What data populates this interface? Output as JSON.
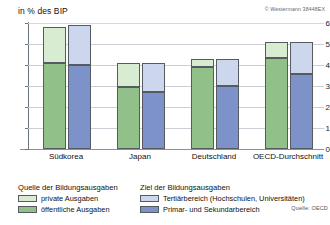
{
  "header": {
    "axis_title": "in % des BIP",
    "copyright": "© Westermann 38448EX"
  },
  "legend": {
    "source_heading": "Quelle der Bildungsausgaben",
    "target_heading": "Ziel der Bildungsausgaben",
    "items": [
      {
        "label": "private Ausgaben",
        "color": "#d8ecd2"
      },
      {
        "label": "öffentliche Ausgaben",
        "color": "#92c089"
      },
      {
        "label": "Tertiärbereich (Hochschulen, Universitäten)",
        "color": "#ccd7ee"
      },
      {
        "label": "Primar- und Sekundarbereich",
        "color": "#7d92c9"
      }
    ],
    "source_note": "Quelle: OECD"
  },
  "caption": "Bildungsausgaben im internationalen Vergleich (2015)",
  "chart_data": {
    "type": "bar",
    "title": "",
    "subtitle": "",
    "xlabel": "",
    "ylabel": "in % des BIP",
    "ylim": [
      0,
      6
    ],
    "yticks": [
      0,
      1,
      2,
      3,
      4,
      5,
      6
    ],
    "ytick_labels": [
      "0",
      "1",
      "2",
      "3",
      "4",
      "5",
      "6"
    ],
    "grid": true,
    "legend_position": "bottom",
    "stacked": true,
    "categories": [
      "Südkorea",
      "Japan",
      "Deutschland",
      "OECD-Durchschnitt"
    ],
    "bar_groups": [
      {
        "name": "Quelle der Bildungsausgaben",
        "bar_key": "green",
        "series": [
          {
            "name": "öffentliche Ausgaben",
            "color": "#92c089",
            "segment": "lower",
            "values": [
              4.1,
              2.95,
              3.9,
              4.35
            ]
          },
          {
            "name": "private Ausgaben",
            "color": "#d8ecd2",
            "segment": "upper",
            "values": [
              1.7,
              1.15,
              0.4,
              0.75
            ]
          }
        ],
        "totals": [
          5.8,
          4.1,
          4.3,
          5.1
        ]
      },
      {
        "name": "Ziel der Bildungsausgaben",
        "bar_key": "blue",
        "series": [
          {
            "name": "Primar- und Sekundarbereich",
            "color": "#7d92c9",
            "segment": "lower",
            "values": [
              4.0,
              2.7,
              3.0,
              3.55
            ]
          },
          {
            "name": "Tertiärbereich (Hochschulen, Universitäten)",
            "color": "#ccd7ee",
            "segment": "upper",
            "values": [
              1.9,
              1.4,
              1.3,
              1.55
            ]
          }
        ],
        "totals": [
          5.9,
          4.1,
          4.3,
          5.1
        ]
      }
    ],
    "annotations": [
      "© Westermann 38448EX",
      "Quelle: OECD"
    ]
  }
}
